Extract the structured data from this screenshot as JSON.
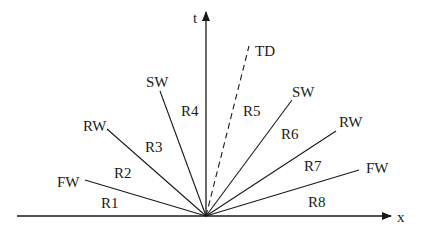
{
  "diagram": {
    "origin": {
      "x": 206,
      "y": 216
    },
    "axes": {
      "x": {
        "label": "x",
        "from": [
          17,
          216
        ],
        "to": [
          391,
          216
        ],
        "label_pos": [
          397,
          222
        ]
      },
      "t": {
        "label": "t",
        "from": [
          206,
          216
        ],
        "to": [
          206,
          12
        ],
        "label_pos": [
          193,
          23
        ]
      }
    },
    "waves": [
      {
        "id": "fw-left",
        "label": "FW",
        "end": [
          85,
          180
        ],
        "label_pos": [
          57,
          187
        ],
        "style": "solid"
      },
      {
        "id": "rw-left",
        "label": "RW",
        "end": [
          107,
          129
        ],
        "label_pos": [
          83,
          131
        ],
        "style": "solid"
      },
      {
        "id": "sw-left",
        "label": "SW",
        "end": [
          160,
          91
        ],
        "label_pos": [
          146,
          87
        ],
        "style": "solid"
      },
      {
        "id": "td",
        "label": "TD",
        "end": [
          249,
          46
        ],
        "label_pos": [
          255,
          56
        ],
        "style": "dashed"
      },
      {
        "id": "sw-right",
        "label": "SW",
        "end": [
          292,
          100
        ],
        "label_pos": [
          292,
          97
        ],
        "style": "solid"
      },
      {
        "id": "rw-right",
        "label": "RW",
        "end": [
          336,
          131
        ],
        "label_pos": [
          339,
          127
        ],
        "style": "solid"
      },
      {
        "id": "fw-right",
        "label": "FW",
        "end": [
          359,
          170
        ],
        "label_pos": [
          366,
          173
        ],
        "style": "solid"
      }
    ],
    "regions": [
      {
        "label": "R1",
        "pos": [
          101,
          208
        ]
      },
      {
        "label": "R2",
        "pos": [
          114,
          178
        ]
      },
      {
        "label": "R3",
        "pos": [
          145,
          152
        ]
      },
      {
        "label": "R4",
        "pos": [
          181,
          116
        ]
      },
      {
        "label": "R5",
        "pos": [
          243,
          116
        ]
      },
      {
        "label": "R6",
        "pos": [
          281,
          139
        ]
      },
      {
        "label": "R7",
        "pos": [
          304,
          171
        ]
      },
      {
        "label": "R8",
        "pos": [
          308,
          207
        ]
      }
    ],
    "colors": {
      "line": "#1a1a1a",
      "background": "#ffffff"
    }
  }
}
